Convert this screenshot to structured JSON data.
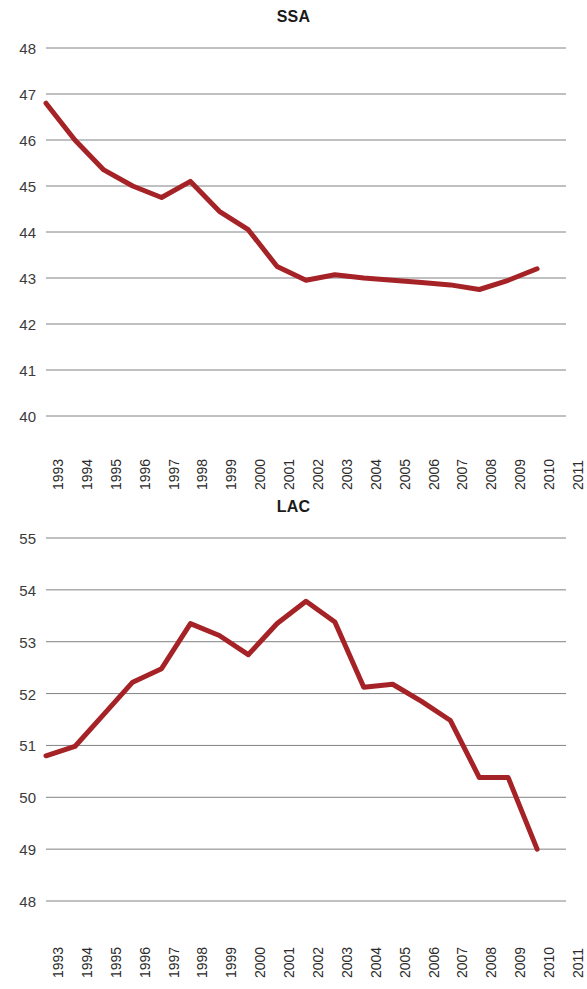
{
  "figure": {
    "background_color": "#ffffff",
    "line_color": "#a52327",
    "gridline_color": "#808285",
    "text_color": "#231f20"
  },
  "charts": [
    {
      "id": "ssa",
      "title": "SSA",
      "ytick_labels": [
        "48",
        "47",
        "46",
        "45",
        "44",
        "43",
        "42",
        "41",
        "40"
      ],
      "xtick_labels": [
        "1993",
        "1994",
        "1995",
        "1996",
        "1997",
        "1998",
        "1999",
        "2000",
        "2001",
        "2002",
        "2003",
        "2004",
        "2005",
        "2006",
        "2007",
        "2008",
        "2009",
        "2010",
        "2011"
      ]
    },
    {
      "id": "lac",
      "title": "LAC",
      "ytick_labels": [
        "55",
        "54",
        "53",
        "52",
        "51",
        "50",
        "49",
        "48"
      ],
      "xtick_labels": [
        "1993",
        "1994",
        "1995",
        "1996",
        "1997",
        "1998",
        "1999",
        "2000",
        "2001",
        "2002",
        "2003",
        "2004",
        "2005",
        "2006",
        "2007",
        "2008",
        "2009",
        "2010",
        "2011"
      ]
    }
  ],
  "chart_data": [
    {
      "type": "line",
      "title": "SSA",
      "xlabel": "",
      "ylabel": "",
      "x": [
        1993,
        1994,
        1995,
        1996,
        1997,
        1998,
        1999,
        2000,
        2001,
        2002,
        2003,
        2004,
        2005,
        2006,
        2007,
        2008,
        2009,
        2010,
        2011
      ],
      "categories": [
        "1993",
        "1994",
        "1995",
        "1996",
        "1997",
        "1998",
        "1999",
        "2000",
        "2001",
        "2002",
        "2003",
        "2004",
        "2005",
        "2006",
        "2007",
        "2008",
        "2009",
        "2010",
        "2011"
      ],
      "values": [
        46.8,
        46.0,
        45.35,
        45.0,
        44.75,
        45.1,
        44.05,
        43.25,
        42.95,
        43.05,
        43.0,
        42.95,
        42.9,
        42.85,
        42.75,
        43.2
      ],
      "series": [
        {
          "name": "SSA",
          "values": [
            46.8,
            46.0,
            45.35,
            45.0,
            44.75,
            45.1,
            44.45,
            44.05,
            43.25,
            42.95,
            43.07,
            43.0,
            42.95,
            42.9,
            42.85,
            42.75,
            42.95,
            43.2,
            null
          ]
        }
      ],
      "ylim": [
        40,
        48
      ],
      "ytick_values": [
        40,
        41,
        42,
        43,
        44,
        45,
        46,
        47,
        48
      ],
      "grid": "horizontal",
      "legend": "none",
      "line_color": "#a52327"
    },
    {
      "type": "line",
      "title": "LAC",
      "xlabel": "",
      "ylabel": "",
      "x": [
        1993,
        1994,
        1995,
        1996,
        1997,
        1998,
        1999,
        2000,
        2001,
        2002,
        2003,
        2004,
        2005,
        2006,
        2007,
        2008,
        2009,
        2010,
        2011
      ],
      "categories": [
        "1993",
        "1994",
        "1995",
        "1996",
        "1997",
        "1998",
        "1999",
        "2000",
        "2001",
        "2002",
        "2003",
        "2004",
        "2005",
        "2006",
        "2007",
        "2008",
        "2009",
        "2010",
        "2011"
      ],
      "series": [
        {
          "name": "LAC",
          "values": [
            50.8,
            50.98,
            51.6,
            52.22,
            52.48,
            53.35,
            53.12,
            52.75,
            53.35,
            53.78,
            53.38,
            52.12,
            52.18,
            51.85,
            51.48,
            50.38,
            50.38,
            49.0,
            null
          ]
        }
      ],
      "ylim": [
        48,
        55
      ],
      "ytick_values": [
        48,
        49,
        50,
        51,
        52,
        53,
        54,
        55
      ],
      "grid": "horizontal",
      "legend": "none",
      "line_color": "#a52327"
    }
  ]
}
